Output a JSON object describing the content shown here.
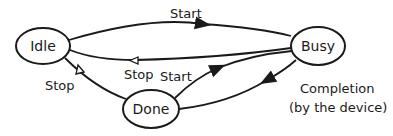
{
  "diagram": {
    "type": "state-machine",
    "nodes": [
      {
        "id": "idle",
        "label": "Idle"
      },
      {
        "id": "busy",
        "label": "Busy"
      },
      {
        "id": "done",
        "label": "Done"
      }
    ],
    "edges": [
      {
        "from": "idle",
        "to": "busy",
        "label": "Start",
        "arrow": "filled"
      },
      {
        "from": "busy",
        "to": "idle",
        "label": "Stop",
        "arrow": "open"
      },
      {
        "from": "done",
        "to": "idle",
        "label": "Stop",
        "arrow": "open"
      },
      {
        "from": "done",
        "to": "busy",
        "label": "Start",
        "arrow": "filled"
      },
      {
        "from": "busy",
        "to": "done",
        "label": "Completion",
        "sublabel": "(by the device)",
        "arrow": "filled"
      }
    ],
    "colors": {
      "stroke": "#1a1a1a",
      "background": "#ffffff"
    }
  }
}
